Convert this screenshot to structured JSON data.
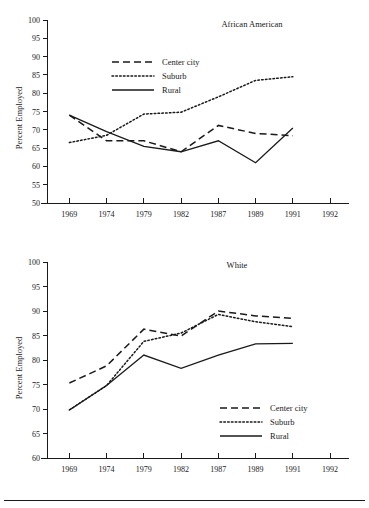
{
  "figure": {
    "panels": [
      "african-american",
      "white"
    ],
    "footer_rule": true
  },
  "chart_data": [
    {
      "type": "line",
      "id": "african-american",
      "title": "African American",
      "xlabel": "",
      "ylabel": "Percent Employed",
      "categories": [
        "1969",
        "1974",
        "1979",
        "1982",
        "1987",
        "1989",
        "1991",
        "1992"
      ],
      "x_tick_labels": [
        "1969",
        "1974",
        "1979",
        "1982",
        "1987",
        "1989",
        "1991",
        "1992"
      ],
      "y_tick_labels": [
        "50",
        "55",
        "60",
        "65",
        "70",
        "75",
        "80",
        "85",
        "90",
        "95",
        "100"
      ],
      "ylim": [
        50,
        100
      ],
      "ytick_step": 5,
      "grid": false,
      "legend_position": "upper-center-left",
      "series": [
        {
          "name": "Center city",
          "style": "dashed",
          "x": [
            "1969",
            "1974",
            "1979",
            "1982",
            "1987",
            "1989",
            "1991"
          ],
          "values": [
            74.0,
            67.0,
            67.0,
            64.0,
            71.2,
            69.0,
            68.4
          ]
        },
        {
          "name": "Suburb",
          "style": "dotted",
          "x": [
            "1969",
            "1974",
            "1979",
            "1982",
            "1987",
            "1989",
            "1991"
          ],
          "values": [
            66.5,
            68.5,
            74.3,
            74.8,
            79.0,
            83.5,
            84.5
          ]
        },
        {
          "name": "Rural",
          "style": "solid",
          "x": [
            "1969",
            "1974",
            "1979",
            "1982",
            "1987",
            "1989",
            "1991"
          ],
          "values": [
            74.0,
            69.5,
            65.5,
            64.0,
            67.0,
            61.0,
            70.5
          ]
        }
      ]
    },
    {
      "type": "line",
      "id": "white",
      "title": "White",
      "xlabel": "",
      "ylabel": "Percent Employed",
      "categories": [
        "1969",
        "1974",
        "1979",
        "1982",
        "1987",
        "1989",
        "1991",
        "1992"
      ],
      "x_tick_labels": [
        "1969",
        "1974",
        "1979",
        "1982",
        "1987",
        "1989",
        "1991",
        "1992"
      ],
      "y_tick_labels": [
        "60",
        "65",
        "70",
        "75",
        "80",
        "85",
        "90",
        "95",
        "100"
      ],
      "ylim": [
        60,
        100
      ],
      "ytick_step": 5,
      "grid": false,
      "legend_position": "lower-right",
      "series": [
        {
          "name": "Center city",
          "style": "dashed",
          "x": [
            "1969",
            "1974",
            "1979",
            "1982",
            "1987",
            "1989",
            "1991"
          ],
          "values": [
            75.3,
            78.8,
            86.3,
            84.9,
            90.0,
            89.0,
            88.5
          ]
        },
        {
          "name": "Suburb",
          "style": "dotted",
          "x": [
            "1969",
            "1974",
            "1979",
            "1982",
            "1987",
            "1989",
            "1991"
          ],
          "values": [
            69.8,
            74.8,
            83.8,
            85.5,
            89.3,
            87.8,
            86.8
          ]
        },
        {
          "name": "Rural",
          "style": "solid",
          "x": [
            "1969",
            "1974",
            "1979",
            "1982",
            "1987",
            "1989",
            "1991"
          ],
          "values": [
            69.8,
            74.8,
            81.0,
            78.3,
            81.0,
            83.3,
            83.4
          ]
        }
      ]
    }
  ],
  "colors": {
    "ink": "#1a1a1a",
    "background": "#ffffff"
  }
}
